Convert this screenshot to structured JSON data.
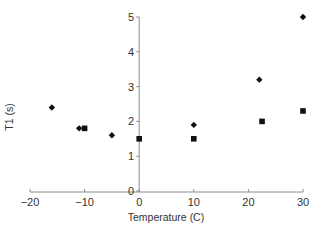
{
  "chart_data": {
    "type": "scatter",
    "title": "",
    "xlabel": "Temperature (C)",
    "ylabel": "T1 (s)",
    "xlim": [
      -20,
      30
    ],
    "ylim": [
      0,
      5
    ],
    "xticks": [
      -20,
      -10,
      0,
      10,
      20,
      30
    ],
    "yticks": [
      0,
      1,
      2,
      3,
      4,
      5
    ],
    "xtick_labels": [
      "−20",
      "−10",
      "0",
      "10",
      "20",
      "30"
    ],
    "ytick_labels": [
      "0",
      "1",
      "2",
      "3",
      "4",
      "5"
    ],
    "grid": false,
    "legend": null,
    "series": [
      {
        "name": "diamonds",
        "marker": "diamond",
        "color": "#111111",
        "points": [
          {
            "x": -16,
            "y": 2.4
          },
          {
            "x": -11,
            "y": 1.8
          },
          {
            "x": -5,
            "y": 1.6
          },
          {
            "x": 10,
            "y": 1.9
          },
          {
            "x": 22,
            "y": 3.2
          },
          {
            "x": 30,
            "y": 5.0
          }
        ]
      },
      {
        "name": "squares",
        "marker": "square",
        "color": "#111111",
        "points": [
          {
            "x": -10,
            "y": 1.8
          },
          {
            "x": 0,
            "y": 1.5
          },
          {
            "x": 10,
            "y": 1.5
          },
          {
            "x": 22.5,
            "y": 2.0
          },
          {
            "x": 30,
            "y": 2.3
          }
        ]
      }
    ]
  },
  "colors": {
    "axis": "#8c8c8c",
    "text": "#333333",
    "marker": "#111111"
  }
}
